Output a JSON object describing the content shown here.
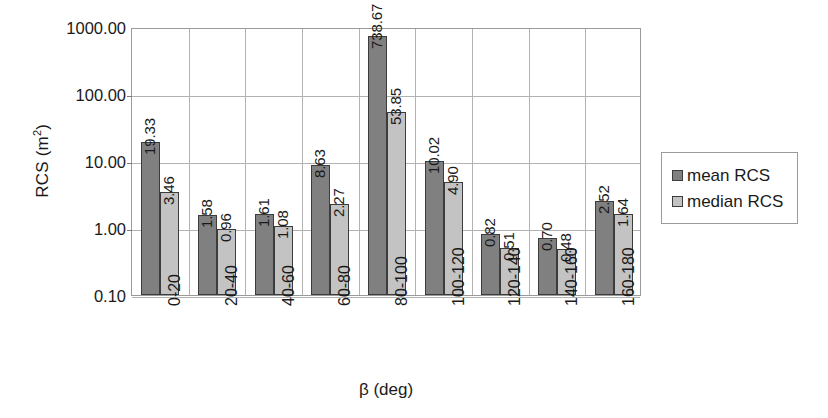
{
  "chart_data": {
    "type": "bar",
    "title": "",
    "xlabel": "β (deg)",
    "ylabel": "RCS (m²)",
    "ylabel_base": "RCS (m",
    "ylabel_sup": "2",
    "ylabel_tail": ")",
    "yscale": "log",
    "ylim": [
      0.1,
      1000.0
    ],
    "grid": "horizontal-and-category-separators",
    "legend_position": "right",
    "categories": [
      "0-20",
      "20-40",
      "40-60",
      "60-80",
      "80-100",
      "100-120",
      "120-140",
      "140-160",
      "160-180"
    ],
    "ytick_labels": [
      "1000.00",
      "100.00",
      "10.00",
      "1.00",
      "0.10"
    ],
    "ytick_values": [
      1000,
      100,
      10,
      1,
      0.1
    ],
    "series": [
      {
        "name": "mean RCS",
        "color": "#808080",
        "values": [
          19.33,
          1.58,
          1.61,
          8.63,
          738.67,
          10.02,
          0.82,
          0.7,
          2.52
        ],
        "labels": [
          "19.33",
          "1.58",
          "1.61",
          "8.63",
          "738.67",
          "10.02",
          "0.82",
          "0.70",
          "2.52"
        ]
      },
      {
        "name": "median RCS",
        "color": "#c3c3c3",
        "values": [
          3.46,
          0.96,
          1.08,
          2.27,
          53.85,
          4.9,
          0.51,
          0.48,
          1.64
        ],
        "labels": [
          "3.46",
          "0.96",
          "1.08",
          "2.27",
          "53.85",
          "4.90",
          "0.51",
          "0.48",
          "1.64"
        ]
      }
    ]
  },
  "legend": {
    "items": [
      {
        "label": "mean RCS",
        "swatch": "mean"
      },
      {
        "label": "median RCS",
        "swatch": "median"
      }
    ]
  }
}
